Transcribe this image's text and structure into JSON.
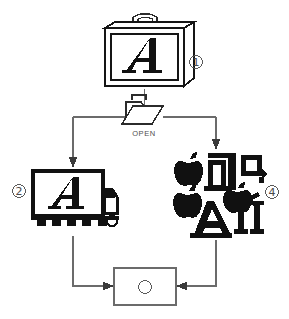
{
  "diagram": {
    "type": "flowchart",
    "background_color": "#ffffff",
    "line_color": "#6b6b6b",
    "ink_color": "#111111",
    "nodes": [
      {
        "id": "node-1",
        "marker": "①",
        "marker_plain": "1",
        "icon": "briefcase-with-letter-a-icon",
        "glyph": "A",
        "description": "Suitcase / font suitcase containing letter A"
      },
      {
        "id": "node-open",
        "marker": "",
        "icon": "open-folder-icon",
        "label": "OPEN",
        "description": "Open folder splitting the flow into two branches"
      },
      {
        "id": "node-2",
        "marker": "②",
        "marker_plain": "2",
        "icon": "delivery-truck-with-letter-a-icon",
        "glyph": "A",
        "description": "Truck carrying the letter A"
      },
      {
        "id": "node-3",
        "marker": "③",
        "marker_plain": "3",
        "icon": "font-characters-cluster-icon",
        "glyphs": [
          "",
          "a",
          "q",
          "",
          "A",
          "II"
        ],
        "description": "Cluster of font character icons: apple marks, a, q, A and II"
      },
      {
        "id": "node-4",
        "marker": "④",
        "marker_plain": "4",
        "icon": "empty-rectangle-node",
        "label": "",
        "description": "Empty destination box receiving both branches"
      }
    ],
    "edges": [
      {
        "from": "node-1",
        "to": "node-open",
        "style": "plain"
      },
      {
        "from": "node-open",
        "to": "node-2",
        "style": "arrow-down"
      },
      {
        "from": "node-open",
        "to": "node-3",
        "style": "arrow-down"
      },
      {
        "from": "node-2",
        "to": "node-4",
        "style": "arrow-right"
      },
      {
        "from": "node-3",
        "to": "node-4",
        "style": "arrow-left"
      }
    ]
  }
}
